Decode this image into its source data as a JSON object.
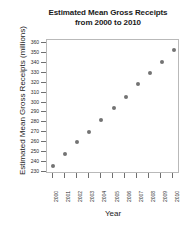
{
  "chart_data": {
    "type": "scatter",
    "title": "Estimated Mean Gross Receipts from 2000 to 2010",
    "title_line1": "Estimated Mean Gross Receipts",
    "title_line2": "from 2000 to 2010",
    "xlabel": "Year",
    "ylabel": "Estimated Mean Gross Receipts (millions)",
    "categories": [
      "2000",
      "2001",
      "2002",
      "2003",
      "2004",
      "2005",
      "2006",
      "2007",
      "2008",
      "2009",
      "2010"
    ],
    "x": [
      2000,
      2001,
      2002,
      2003,
      2004,
      2005,
      2006,
      2007,
      2008,
      2009,
      2010
    ],
    "values": [
      236,
      248,
      260,
      271,
      283,
      295,
      306,
      319,
      331,
      342,
      354
    ],
    "ylim": [
      228,
      364
    ],
    "xlim": [
      1999.5,
      2010.5
    ],
    "yticks": [
      230,
      240,
      250,
      260,
      270,
      280,
      290,
      300,
      310,
      320,
      330,
      340,
      350,
      360
    ],
    "ytick_labels": [
      "230",
      "240",
      "250",
      "260",
      "270",
      "280",
      "290",
      "300",
      "310",
      "320",
      "330",
      "340",
      "350",
      "360"
    ],
    "xticks": [
      2000,
      2001,
      2002,
      2003,
      2004,
      2005,
      2006,
      2007,
      2008,
      2009,
      2010
    ],
    "xtick_labels": [
      "2000",
      "2001",
      "2002",
      "2003",
      "2004",
      "2005",
      "2006",
      "2007",
      "2008",
      "2009",
      "2010"
    ],
    "grid": false,
    "legend": false,
    "marker_color": "#737373",
    "marker_shape": "circle",
    "axis_color": "#b9b9b9",
    "text_color": "#1a1a1a",
    "background": "#ffffff"
  }
}
